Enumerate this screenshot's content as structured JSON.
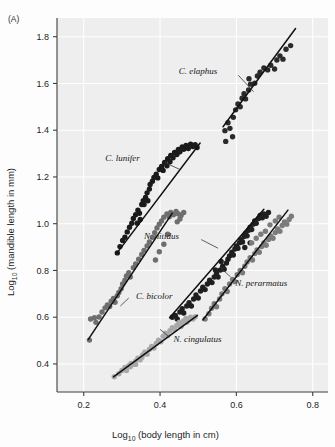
{
  "figure": {
    "panel_label": "(A)",
    "background_color": "#eeeeee"
  },
  "axes": {
    "x_title_main": "Log",
    "x_title_sub": "10",
    "x_title_rest": " (body length in cm)",
    "y_title_main": "Log",
    "y_title_sub": "10",
    "y_title_rest": " (mandible length in mm)",
    "x_ticks": [
      "0.2",
      "0.4",
      "0.6",
      "0.8"
    ],
    "y_ticks": [
      "0.4",
      "0.6",
      "0.8",
      "1.0",
      "1.2",
      "1.4",
      "1.6",
      "1.8"
    ]
  },
  "chart_data": {
    "type": "scatter",
    "title": "",
    "xlabel": "Log10 (body length in cm)",
    "ylabel": "Log10 (mandible length in mm)",
    "xlim": [
      0.13,
      0.84
    ],
    "ylim": [
      0.28,
      1.88
    ],
    "grid": true,
    "legend_position": "inline-annotations",
    "series": [
      {
        "name": "C. elaphus",
        "color": "#2a2a2a",
        "label_x": 0.555,
        "label_y": 1.655,
        "leader": [
          [
            0.605,
            1.635
          ],
          [
            0.645,
            1.565
          ]
        ],
        "fit": [
          [
            0.565,
            1.415
          ],
          [
            0.755,
            1.835
          ]
        ],
        "points": [
          [
            0.57,
            1.398
          ],
          [
            0.578,
            1.432
          ],
          [
            0.583,
            1.408
          ],
          [
            0.592,
            1.455
          ],
          [
            0.598,
            1.487
          ],
          [
            0.604,
            1.512
          ],
          [
            0.61,
            1.5
          ],
          [
            0.615,
            1.537
          ],
          [
            0.62,
            1.556
          ],
          [
            0.624,
            1.534
          ],
          [
            0.632,
            1.572
          ],
          [
            0.637,
            1.597
          ],
          [
            0.633,
            1.62
          ],
          [
            0.648,
            1.601
          ],
          [
            0.655,
            1.632
          ],
          [
            0.662,
            1.648
          ],
          [
            0.672,
            1.666
          ],
          [
            0.682,
            1.658
          ],
          [
            0.69,
            1.678
          ],
          [
            0.7,
            1.662
          ],
          [
            0.706,
            1.7
          ],
          [
            0.714,
            1.718
          ],
          [
            0.722,
            1.704
          ],
          [
            0.73,
            1.746
          ],
          [
            0.742,
            1.762
          ],
          [
            0.59,
            1.372
          ],
          [
            0.572,
            1.352
          ]
        ]
      },
      {
        "name": "C. lunifer",
        "color": "#1a1a1a",
        "label_x": 0.352,
        "label_y": 1.282,
        "leader": [
          [
            0.412,
            1.262
          ],
          [
            0.452,
            1.232
          ]
        ],
        "fit": [
          [
            0.286,
            0.872
          ],
          [
            0.505,
            1.345
          ]
        ],
        "points": [
          [
            0.288,
            0.875
          ],
          [
            0.295,
            0.902
          ],
          [
            0.302,
            0.928
          ],
          [
            0.308,
            0.942
          ],
          [
            0.314,
            0.965
          ],
          [
            0.32,
            0.985
          ],
          [
            0.326,
            1.002
          ],
          [
            0.33,
            1.022
          ],
          [
            0.336,
            1.038
          ],
          [
            0.342,
            1.058
          ],
          [
            0.346,
            1.045
          ],
          [
            0.352,
            1.082
          ],
          [
            0.356,
            1.098
          ],
          [
            0.362,
            1.112
          ],
          [
            0.366,
            1.132
          ],
          [
            0.372,
            1.148
          ],
          [
            0.374,
            1.168
          ],
          [
            0.38,
            1.182
          ],
          [
            0.384,
            1.198
          ],
          [
            0.39,
            1.212
          ],
          [
            0.394,
            1.196
          ],
          [
            0.398,
            1.232
          ],
          [
            0.404,
            1.245
          ],
          [
            0.408,
            1.228
          ],
          [
            0.412,
            1.262
          ],
          [
            0.418,
            1.248
          ],
          [
            0.42,
            1.278
          ],
          [
            0.426,
            1.265
          ],
          [
            0.428,
            1.292
          ],
          [
            0.434,
            1.282
          ],
          [
            0.438,
            1.305
          ],
          [
            0.444,
            1.296
          ],
          [
            0.448,
            1.318
          ],
          [
            0.452,
            1.308
          ],
          [
            0.458,
            1.328
          ],
          [
            0.462,
            1.318
          ],
          [
            0.468,
            1.335
          ],
          [
            0.474,
            1.322
          ],
          [
            0.48,
            1.34
          ],
          [
            0.486,
            1.33
          ],
          [
            0.492,
            1.338
          ],
          [
            0.497,
            1.326
          ],
          [
            0.358,
            1.082
          ],
          [
            0.368,
            1.098
          ],
          [
            0.34,
            1.002
          ],
          [
            0.348,
            1.018
          ]
        ]
      },
      {
        "name": "C. bicolor",
        "color": "#6e6e6e",
        "label_x": 0.332,
        "label_y": 0.692,
        "leader": [
          [
            0.318,
            0.682
          ],
          [
            0.296,
            0.648
          ]
        ],
        "fit": [
          [
            0.212,
            0.505
          ],
          [
            0.432,
            1.045
          ]
        ],
        "points": [
          [
            0.215,
            0.502
          ],
          [
            0.218,
            0.592
          ],
          [
            0.228,
            0.598
          ],
          [
            0.232,
            0.578
          ],
          [
            0.24,
            0.601
          ],
          [
            0.248,
            0.622
          ],
          [
            0.256,
            0.64
          ],
          [
            0.262,
            0.652
          ],
          [
            0.268,
            0.646
          ],
          [
            0.272,
            0.668
          ],
          [
            0.278,
            0.68
          ],
          [
            0.282,
            0.664
          ],
          [
            0.288,
            0.692
          ],
          [
            0.292,
            0.706
          ],
          [
            0.298,
            0.722
          ],
          [
            0.302,
            0.742
          ],
          [
            0.308,
            0.758
          ],
          [
            0.312,
            0.776
          ],
          [
            0.318,
            0.79
          ],
          [
            0.322,
            0.772
          ],
          [
            0.33,
            0.812
          ],
          [
            0.336,
            0.828
          ],
          [
            0.344,
            0.848
          ],
          [
            0.352,
            0.868
          ],
          [
            0.358,
            0.886
          ],
          [
            0.366,
            0.905
          ],
          [
            0.372,
            0.922
          ],
          [
            0.38,
            0.942
          ],
          [
            0.386,
            0.962
          ],
          [
            0.392,
            0.982
          ],
          [
            0.398,
            0.998
          ],
          [
            0.404,
            1.012
          ],
          [
            0.41,
            1.028
          ],
          [
            0.418,
            1.042
          ],
          [
            0.424,
            1.03
          ],
          [
            0.428,
            1.048
          ],
          [
            0.435,
            1.038
          ],
          [
            0.442,
            1.052
          ],
          [
            0.448,
            1.042
          ],
          [
            0.455,
            1.035
          ],
          [
            0.462,
            1.048
          ],
          [
            0.42,
            0.955
          ],
          [
            0.41,
            0.912
          ],
          [
            0.398,
            0.88
          ],
          [
            0.445,
            1.008
          ],
          [
            0.452,
            1.02
          ],
          [
            0.388,
            0.845
          ]
        ]
      },
      {
        "name": "N. nitidus",
        "color": "#1f1f1f",
        "label_x": 0.455,
        "label_y": 0.948,
        "leader": [
          [
            0.508,
            0.932
          ],
          [
            0.552,
            0.895
          ]
        ],
        "fit": [
          [
            0.425,
            0.598
          ],
          [
            0.672,
            1.062
          ]
        ],
        "points": [
          [
            0.432,
            0.6
          ],
          [
            0.44,
            0.608
          ],
          [
            0.445,
            0.592
          ],
          [
            0.452,
            0.622
          ],
          [
            0.458,
            0.636
          ],
          [
            0.462,
            0.618
          ],
          [
            0.47,
            0.648
          ],
          [
            0.476,
            0.662
          ],
          [
            0.482,
            0.648
          ],
          [
            0.488,
            0.678
          ],
          [
            0.494,
            0.695
          ],
          [
            0.5,
            0.682
          ],
          [
            0.506,
            0.712
          ],
          [
            0.512,
            0.728
          ],
          [
            0.518,
            0.718
          ],
          [
            0.524,
            0.742
          ],
          [
            0.53,
            0.758
          ],
          [
            0.536,
            0.748
          ],
          [
            0.542,
            0.772
          ],
          [
            0.548,
            0.788
          ],
          [
            0.552,
            0.772
          ],
          [
            0.558,
            0.802
          ],
          [
            0.564,
            0.818
          ],
          [
            0.568,
            0.805
          ],
          [
            0.574,
            0.832
          ],
          [
            0.578,
            0.848
          ],
          [
            0.582,
            0.862
          ],
          [
            0.588,
            0.878
          ],
          [
            0.592,
            0.866
          ],
          [
            0.596,
            0.892
          ],
          [
            0.6,
            0.905
          ],
          [
            0.604,
            0.895
          ],
          [
            0.608,
            0.918
          ],
          [
            0.612,
            0.932
          ],
          [
            0.616,
            0.922
          ],
          [
            0.62,
            0.945
          ],
          [
            0.624,
            0.958
          ],
          [
            0.628,
            0.948
          ],
          [
            0.632,
            0.972
          ],
          [
            0.636,
            0.985
          ],
          [
            0.64,
            0.975
          ],
          [
            0.644,
            0.998
          ],
          [
            0.648,
            1.012
          ],
          [
            0.652,
            1.002
          ],
          [
            0.658,
            1.022
          ],
          [
            0.662,
            1.035
          ],
          [
            0.668,
            1.025
          ],
          [
            0.672,
            1.042
          ],
          [
            0.678,
            1.032
          ],
          [
            0.684,
            1.048
          ],
          [
            0.545,
            0.802
          ],
          [
            0.56,
            0.838
          ],
          [
            0.622,
            0.898
          ],
          [
            0.636,
            0.918
          ]
        ]
      },
      {
        "name": "N. perarmatus",
        "color": "#7b7b7b",
        "label_x": 0.592,
        "label_y": 0.748,
        "leader": [
          [
            0.585,
            0.772
          ],
          [
            0.558,
            0.812
          ]
        ],
        "fit": [
          [
            0.512,
            0.588
          ],
          [
            0.735,
            1.058
          ]
        ],
        "points": [
          [
            0.518,
            0.592
          ],
          [
            0.528,
            0.615
          ],
          [
            0.535,
            0.638
          ],
          [
            0.542,
            0.658
          ],
          [
            0.548,
            0.645
          ],
          [
            0.556,
            0.678
          ],
          [
            0.562,
            0.7
          ],
          [
            0.57,
            0.722
          ],
          [
            0.576,
            0.71
          ],
          [
            0.582,
            0.742
          ],
          [
            0.59,
            0.762
          ],
          [
            0.596,
            0.752
          ],
          [
            0.602,
            0.782
          ],
          [
            0.61,
            0.8
          ],
          [
            0.616,
            0.79
          ],
          [
            0.622,
            0.818
          ],
          [
            0.628,
            0.836
          ],
          [
            0.636,
            0.855
          ],
          [
            0.642,
            0.845
          ],
          [
            0.648,
            0.872
          ],
          [
            0.654,
            0.888
          ],
          [
            0.66,
            0.878
          ],
          [
            0.666,
            0.902
          ],
          [
            0.672,
            0.918
          ],
          [
            0.678,
            0.908
          ],
          [
            0.684,
            0.932
          ],
          [
            0.69,
            0.948
          ],
          [
            0.696,
            0.938
          ],
          [
            0.702,
            0.962
          ],
          [
            0.708,
            0.978
          ],
          [
            0.714,
            0.968
          ],
          [
            0.72,
            0.992
          ],
          [
            0.726,
            1.008
          ],
          [
            0.732,
            0.998
          ],
          [
            0.738,
            1.018
          ],
          [
            0.744,
            1.032
          ],
          [
            0.702,
            1.012
          ],
          [
            0.712,
            1.028
          ],
          [
            0.688,
            0.995
          ],
          [
            0.676,
            0.968
          ],
          [
            0.664,
            0.955
          ],
          [
            0.652,
            0.938
          ],
          [
            0.64,
            0.918
          ]
        ]
      },
      {
        "name": "N. cingulatus",
        "color": "#a8a8a8",
        "label_x": 0.43,
        "label_y": 0.505,
        "leader": [
          [
            0.422,
            0.518
          ],
          [
            0.4,
            0.548
          ]
        ],
        "fit": [
          [
            0.278,
            0.345
          ],
          [
            0.498,
            0.608
          ]
        ],
        "points": [
          [
            0.28,
            0.345
          ],
          [
            0.292,
            0.358
          ],
          [
            0.3,
            0.372
          ],
          [
            0.308,
            0.385
          ],
          [
            0.312,
            0.372
          ],
          [
            0.318,
            0.392
          ],
          [
            0.324,
            0.402
          ],
          [
            0.33,
            0.398
          ],
          [
            0.336,
            0.412
          ],
          [
            0.342,
            0.425
          ],
          [
            0.348,
            0.418
          ],
          [
            0.354,
            0.438
          ],
          [
            0.36,
            0.45
          ],
          [
            0.366,
            0.442
          ],
          [
            0.372,
            0.462
          ],
          [
            0.378,
            0.475
          ],
          [
            0.384,
            0.468
          ],
          [
            0.39,
            0.488
          ],
          [
            0.396,
            0.502
          ],
          [
            0.402,
            0.495
          ],
          [
            0.408,
            0.518
          ],
          [
            0.414,
            0.532
          ],
          [
            0.42,
            0.522
          ],
          [
            0.426,
            0.542
          ],
          [
            0.432,
            0.555
          ],
          [
            0.438,
            0.548
          ],
          [
            0.444,
            0.565
          ],
          [
            0.45,
            0.578
          ],
          [
            0.456,
            0.568
          ],
          [
            0.462,
            0.585
          ],
          [
            0.468,
            0.595
          ],
          [
            0.474,
            0.588
          ],
          [
            0.48,
            0.6
          ],
          [
            0.486,
            0.592
          ],
          [
            0.492,
            0.602
          ],
          [
            0.352,
            0.428
          ],
          [
            0.336,
            0.398
          ],
          [
            0.322,
            0.388
          ],
          [
            0.47,
            0.578
          ],
          [
            0.455,
            0.56
          ]
        ]
      }
    ]
  }
}
